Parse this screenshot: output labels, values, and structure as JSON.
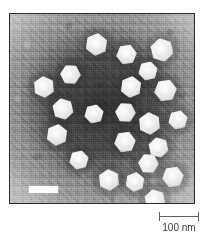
{
  "figure": {
    "type": "transmission-electron-micrograph",
    "caption_text": "",
    "background_color": "#ffffff"
  },
  "micrograph": {
    "alt_text": "Negative-stain transmission electron micrograph of icosahedral virus particles",
    "frame_color": "#2b2b2b",
    "stain_background_color": "#8a8a8a",
    "particle_color": "#ffffff",
    "particle_count": 22,
    "particles": [
      {
        "id": "particle-01",
        "x": 75,
        "y": 19,
        "size": 23
      },
      {
        "id": "particle-02",
        "x": 106,
        "y": 30,
        "size": 21
      },
      {
        "id": "particle-03",
        "x": 140,
        "y": 24,
        "size": 24
      },
      {
        "id": "particle-04",
        "x": 128,
        "y": 47,
        "size": 20
      },
      {
        "id": "particle-05",
        "x": 50,
        "y": 50,
        "size": 21
      },
      {
        "id": "particle-06",
        "x": 23,
        "y": 62,
        "size": 22
      },
      {
        "id": "particle-07",
        "x": 110,
        "y": 62,
        "size": 22
      },
      {
        "id": "particle-08",
        "x": 144,
        "y": 65,
        "size": 23
      },
      {
        "id": "particle-09",
        "x": 42,
        "y": 84,
        "size": 22
      },
      {
        "id": "particle-10",
        "x": 74,
        "y": 90,
        "size": 20
      },
      {
        "id": "particle-11",
        "x": 105,
        "y": 88,
        "size": 21
      },
      {
        "id": "particle-12",
        "x": 128,
        "y": 98,
        "size": 23
      },
      {
        "id": "particle-13",
        "x": 36,
        "y": 110,
        "size": 22
      },
      {
        "id": "particle-14",
        "x": 104,
        "y": 117,
        "size": 22
      },
      {
        "id": "particle-15",
        "x": 138,
        "y": 123,
        "size": 21
      },
      {
        "id": "particle-16",
        "x": 59,
        "y": 136,
        "size": 20
      },
      {
        "id": "particle-17",
        "x": 128,
        "y": 139,
        "size": 21
      },
      {
        "id": "particle-18",
        "x": 88,
        "y": 155,
        "size": 22
      },
      {
        "id": "particle-19",
        "x": 115,
        "y": 158,
        "size": 20
      },
      {
        "id": "particle-20",
        "x": 152,
        "y": 152,
        "size": 22
      },
      {
        "id": "particle-21",
        "x": 134,
        "y": 175,
        "size": 22
      },
      {
        "id": "particle-22",
        "x": 158,
        "y": 96,
        "size": 20
      }
    ],
    "internal_scale_bar": {
      "label": "",
      "color": "#fdfdfd"
    }
  },
  "scale_marker": {
    "label": "100 nm",
    "value": 100,
    "unit": "nm",
    "line_color": "#5f5f5f",
    "text_color": "#3a3a3a"
  }
}
